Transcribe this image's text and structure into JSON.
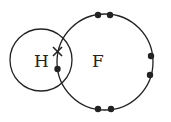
{
  "diagram": {
    "atoms": [
      {
        "symbol": "H",
        "label": "H"
      },
      {
        "symbol": "F",
        "label": "F"
      }
    ],
    "shared_pair": {
      "cross": "x",
      "dot": "•"
    },
    "lone_pairs": [
      "top",
      "right",
      "bottom"
    ],
    "colors": {
      "line": "#222222",
      "background": "#ffffff"
    }
  }
}
